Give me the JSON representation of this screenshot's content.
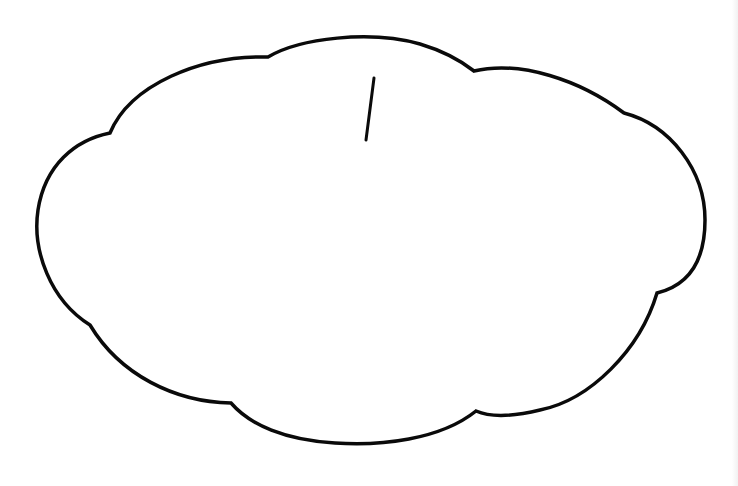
{
  "diagram": {
    "background_color": "#ffffff",
    "stroke_color": "#0a0a0a",
    "stroke_width": 3.5,
    "shapes": [
      {
        "type": "cloud-outline",
        "name": "cloud",
        "lobe_cusps": [
          [
            268,
            57
          ],
          [
            474,
            71
          ],
          [
            624,
            113
          ],
          [
            657,
            293
          ],
          [
            476,
            411
          ],
          [
            231,
            403
          ],
          [
            90,
            325
          ],
          [
            110,
            133
          ]
        ],
        "bounds": {
          "left": 35,
          "top": 36,
          "right": 705,
          "bottom": 445
        }
      },
      {
        "type": "line",
        "name": "tick-mark",
        "from": [
          374,
          78
        ],
        "to": [
          366,
          140
        ]
      }
    ],
    "text_labels": []
  }
}
